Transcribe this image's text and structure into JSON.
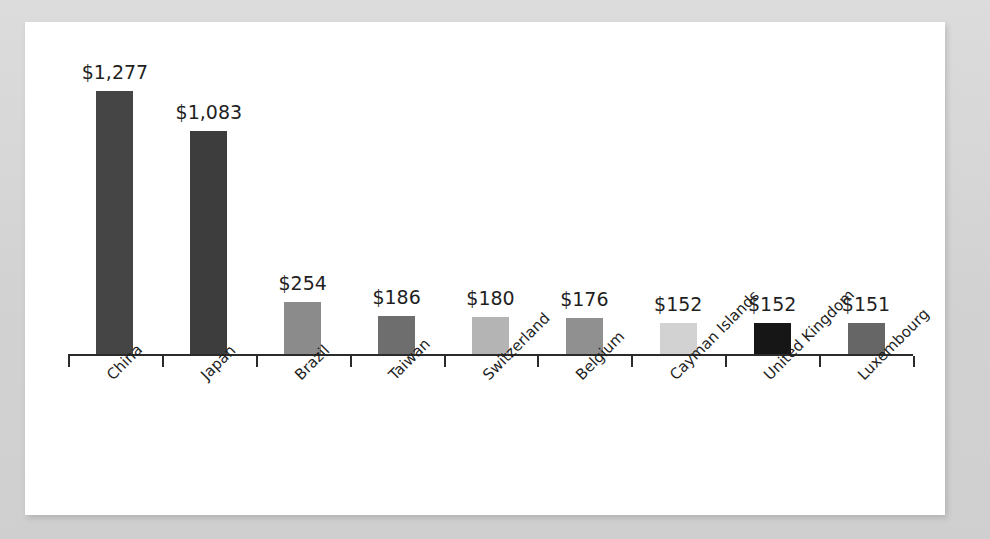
{
  "canvas": {
    "width": 990,
    "height": 539,
    "background_color": "#d4d4d4",
    "card_background_color": "#ffffff"
  },
  "chart_data": {
    "type": "bar",
    "title": "",
    "subtitle": "",
    "xlabel": "",
    "ylabel": "",
    "categories": [
      "China",
      "Japan",
      "Brazil",
      "Taiwan",
      "Switzerland",
      "Belgium",
      "Cayman Islands",
      "United Kingdom",
      "Luxembourg"
    ],
    "values": [
      1277,
      1083,
      254,
      186,
      180,
      176,
      152,
      152,
      151
    ],
    "value_labels": [
      "$1,277",
      "$1,083",
      "$254",
      "$186",
      "$180",
      "$176",
      "$152",
      "$152",
      "$151"
    ],
    "bar_colors": [
      "#454545",
      "#3d3d3d",
      "#8b8b8b",
      "#6e6e6e",
      "#b4b4b4",
      "#909090",
      "#d2d2d2",
      "#161616",
      "#666666"
    ],
    "ylim": [
      0,
      1400
    ],
    "grid": false,
    "legend": "none",
    "axis_color": "#2b2b2b",
    "label_rotation_degrees": -45,
    "value_label_position": "above-bar"
  }
}
